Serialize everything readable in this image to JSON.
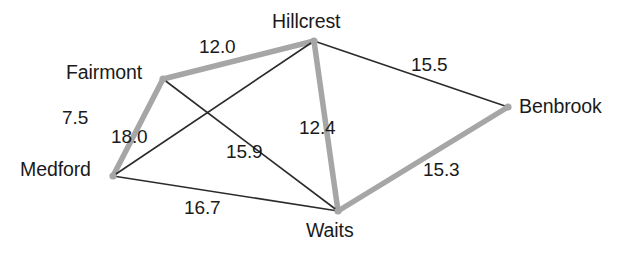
{
  "diagram": {
    "type": "weighted-undirected-graph",
    "title": "",
    "width": 619,
    "height": 257,
    "background_color": "#ffffff",
    "colors": {
      "highlighted_edge": "#a6a6a6",
      "normal_edge": "#2b2b2b",
      "node_dot": "#a6a6a6",
      "text": "#1a1a1a"
    },
    "nodes": [
      {
        "id": "hillcrest",
        "label": "Hillcrest",
        "x": 314,
        "y": 41,
        "label_x": 272,
        "label_y": 12
      },
      {
        "id": "fairmont",
        "label": "Fairmont",
        "x": 163,
        "y": 79,
        "label_x": 66,
        "label_y": 63
      },
      {
        "id": "benbrook",
        "label": "Benbrook",
        "x": 508,
        "y": 107,
        "label_x": 519,
        "label_y": 97
      },
      {
        "id": "medford",
        "label": "Medford",
        "x": 113,
        "y": 176,
        "label_x": 20,
        "label_y": 160
      },
      {
        "id": "waits",
        "label": "Waits",
        "x": 338,
        "y": 211,
        "label_x": 306,
        "label_y": 221
      }
    ],
    "edges": [
      {
        "id": "fairmont-hillcrest",
        "from": "fairmont",
        "to": "hillcrest",
        "weight": "12.0",
        "highlighted": true,
        "label_x": 199,
        "label_y": 37
      },
      {
        "id": "hillcrest-benbrook",
        "from": "hillcrest",
        "to": "benbrook",
        "weight": "15.5",
        "highlighted": false,
        "label_x": 411,
        "label_y": 55
      },
      {
        "id": "fairmont-medford",
        "from": "fairmont",
        "to": "medford",
        "weight": "7.5",
        "highlighted": true,
        "label_x": 62,
        "label_y": 108
      },
      {
        "id": "hillcrest-waits",
        "from": "hillcrest",
        "to": "waits",
        "weight": "12.4",
        "highlighted": true,
        "label_x": 299,
        "label_y": 118
      },
      {
        "id": "hillcrest-medford",
        "from": "hillcrest",
        "to": "medford",
        "weight": "18.0",
        "highlighted": false,
        "label_x": 111,
        "label_y": 127
      },
      {
        "id": "fairmont-waits",
        "from": "fairmont",
        "to": "waits",
        "weight": "15.9",
        "highlighted": false,
        "label_x": 226,
        "label_y": 142
      },
      {
        "id": "waits-benbrook",
        "from": "waits",
        "to": "benbrook",
        "weight": "15.3",
        "highlighted": true,
        "label_x": 423,
        "label_y": 160
      },
      {
        "id": "medford-waits",
        "from": "medford",
        "to": "waits",
        "weight": "16.7",
        "highlighted": false,
        "label_x": 184,
        "label_y": 198
      }
    ]
  },
  "chart_data": {
    "type": "graph",
    "title": "",
    "nodes": [
      "Hillcrest",
      "Fairmont",
      "Benbrook",
      "Medford",
      "Waits"
    ],
    "edges": [
      {
        "source": "Fairmont",
        "target": "Hillcrest",
        "weight": 12.0,
        "highlighted": true
      },
      {
        "source": "Hillcrest",
        "target": "Benbrook",
        "weight": 15.5,
        "highlighted": false
      },
      {
        "source": "Fairmont",
        "target": "Medford",
        "weight": 7.5,
        "highlighted": true
      },
      {
        "source": "Hillcrest",
        "target": "Waits",
        "weight": 12.4,
        "highlighted": true
      },
      {
        "source": "Hillcrest",
        "target": "Medford",
        "weight": 18.0,
        "highlighted": false
      },
      {
        "source": "Fairmont",
        "target": "Waits",
        "weight": 15.9,
        "highlighted": false
      },
      {
        "source": "Waits",
        "target": "Benbrook",
        "weight": 15.3,
        "highlighted": true
      },
      {
        "source": "Medford",
        "target": "Waits",
        "weight": 16.7,
        "highlighted": false
      }
    ],
    "legend": []
  }
}
